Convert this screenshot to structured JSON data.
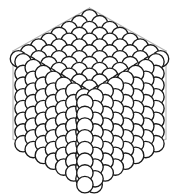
{
  "figure": {
    "projection": "isometric",
    "background_color": "#ffffff",
    "sphere_fill": "#ffffff",
    "sphere_outline_color": "#1a1a1a",
    "wireframe_color": "#b5b5b5",
    "canvas": {
      "width": 179,
      "height": 195
    }
  },
  "chart_data": {
    "type": "scatter",
    "xlabel": "",
    "ylabel": "",
    "xlim": [
      0,
      179
    ],
    "ylim": [
      0,
      195
    ],
    "grid": false,
    "legend": "none",
    "faces": [
      {
        "name": "top-face",
        "label": "Top face (rhombus)",
        "rows": 8,
        "cols": 8,
        "origin": [
          89.5,
          12.0
        ],
        "u_vector": [
          10.15,
          5.85
        ],
        "v_vector": [
          -10.15,
          5.85
        ],
        "radius": 8.2
      },
      {
        "name": "front-left-face",
        "label": "Front-left face (rhombus)",
        "rows": 8,
        "cols": 8,
        "origin": [
          18.0,
          53.0
        ],
        "u_vector": [
          10.15,
          5.85
        ],
        "v_vector": [
          0.0,
          11.7
        ],
        "radius": 8.2
      },
      {
        "name": "front-right-face",
        "label": "Front-right face (rhombus)",
        "rows": 8,
        "cols": 8,
        "origin": [
          161.0,
          53.0
        ],
        "u_vector": [
          -10.15,
          5.85
        ],
        "v_vector": [
          0.0,
          11.7
        ],
        "radius": 8.2
      }
    ],
    "wireframe_vertices": {
      "top": [
        89.5,
        8.0
      ],
      "left": [
        13.0,
        51.0
      ],
      "right": [
        166.0,
        51.0
      ],
      "center": [
        89.5,
        95.0
      ],
      "bottom_left": [
        13.0,
        139.0
      ],
      "bottom_right": [
        166.0,
        139.0
      ],
      "bottom": [
        89.5,
        183.0
      ]
    },
    "wireframe_edges": [
      [
        "top",
        "left"
      ],
      [
        "top",
        "right"
      ],
      [
        "top",
        "center"
      ],
      [
        "left",
        "center"
      ],
      [
        "right",
        "center"
      ],
      [
        "left",
        "bottom_left"
      ],
      [
        "right",
        "bottom_right"
      ],
      [
        "center",
        "bottom"
      ],
      [
        "bottom_left",
        "bottom"
      ],
      [
        "bottom_right",
        "bottom"
      ]
    ]
  }
}
